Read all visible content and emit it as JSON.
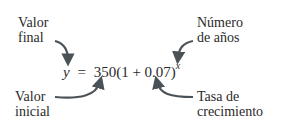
{
  "diagram": {
    "equation": {
      "lhs": "y",
      "equals": "=",
      "rhs_base": "350(1 + 0.07)",
      "exponent": "x"
    },
    "labels": {
      "final_value": [
        "Valor",
        "final"
      ],
      "initial_value": [
        "Valor",
        "inicial"
      ],
      "years": [
        "Número",
        "de años"
      ],
      "growth_rate": [
        "Tasa de",
        "crecimiento"
      ]
    },
    "colors": {
      "text": "#2a2a2a",
      "arrow": "#4a5258"
    }
  }
}
